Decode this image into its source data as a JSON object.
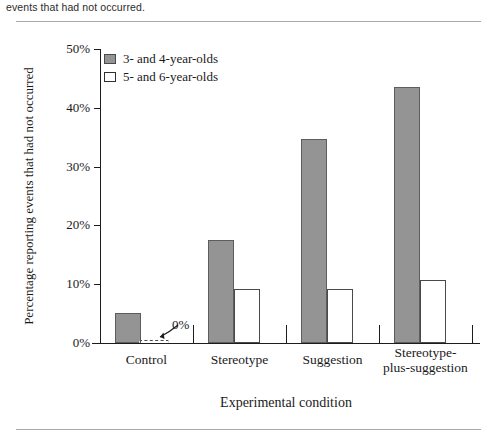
{
  "caption": {
    "text": "events that had not occurred."
  },
  "chart_data": {
    "type": "bar",
    "title": "",
    "subtitle": "",
    "xlabel": "Experimental condition",
    "ylabel": "Percentage reporting events that had not occurred",
    "categories": [
      "Control",
      "Stereotype",
      "Suggestion",
      "Stereotype-plus-suggestion"
    ],
    "series": [
      {
        "name": "3- and 4-year-olds",
        "color": "#949494",
        "values": [
          5.1,
          17.5,
          34.7,
          43.5
        ]
      },
      {
        "name": "5- and 6-year-olds",
        "color": "#ffffff",
        "values": [
          0,
          9.2,
          9.2,
          10.8
        ]
      }
    ],
    "ylim": [
      0,
      50
    ],
    "yticks": [
      0,
      10,
      20,
      30,
      40,
      50
    ],
    "ytick_labels": [
      "0%",
      "10%",
      "20%",
      "30%",
      "40%",
      "50%"
    ],
    "grid": false,
    "legend_position": "top-left",
    "annotations": [
      {
        "label": "0%",
        "target_category": "Control",
        "target_series": "5- and 6-year-olds",
        "value": 0
      }
    ]
  },
  "legend": {
    "items": [
      {
        "label": "3- and 4-year-olds",
        "style": "young"
      },
      {
        "label": "5- and 6-year-olds",
        "style": "old"
      }
    ]
  }
}
